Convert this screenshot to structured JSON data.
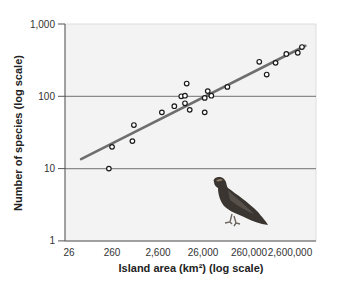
{
  "chart_data": {
    "type": "scatter",
    "title": "",
    "xlabel": "Island area (km²) (log scale)",
    "ylabel": "Number of species (log scale)",
    "x_scale": "log",
    "y_scale": "log",
    "xlim": [
      26,
      5000000
    ],
    "ylim": [
      1,
      1000
    ],
    "x_ticks": [
      "26",
      "260",
      "2,600",
      "26,000",
      "260,000",
      "2,600,000"
    ],
    "x_tick_values": [
      26,
      260,
      2600,
      26000,
      260000,
      2600000
    ],
    "y_ticks": [
      "1",
      "10",
      "100",
      "1,000"
    ],
    "y_tick_values": [
      1,
      10,
      100,
      1000
    ],
    "grid": "horizontal lines at 10 and 100",
    "legend": null,
    "series": [
      {
        "name": "Islands",
        "marker": "open circle",
        "points": [
          {
            "x": 230,
            "y": 10
          },
          {
            "x": 270,
            "y": 20
          },
          {
            "x": 760,
            "y": 24
          },
          {
            "x": 820,
            "y": 40
          },
          {
            "x": 3400,
            "y": 60
          },
          {
            "x": 6400,
            "y": 73
          },
          {
            "x": 9100,
            "y": 100
          },
          {
            "x": 11000,
            "y": 102
          },
          {
            "x": 12000,
            "y": 150
          },
          {
            "x": 11000,
            "y": 80
          },
          {
            "x": 14000,
            "y": 65
          },
          {
            "x": 30000,
            "y": 60
          },
          {
            "x": 30000,
            "y": 95
          },
          {
            "x": 35000,
            "y": 118
          },
          {
            "x": 42000,
            "y": 102
          },
          {
            "x": 95000,
            "y": 135
          },
          {
            "x": 480000,
            "y": 300
          },
          {
            "x": 700000,
            "y": 200
          },
          {
            "x": 1100000,
            "y": 290
          },
          {
            "x": 1900000,
            "y": 385
          },
          {
            "x": 3400000,
            "y": 400
          },
          {
            "x": 4200000,
            "y": 480
          }
        ]
      },
      {
        "name": "Trend line",
        "type": "line",
        "points": [
          {
            "x": 56,
            "y": 13.5
          },
          {
            "x": 5000000,
            "y": 500
          }
        ]
      }
    ],
    "annotations": [
      "bird illustration (hawk) in lower right of plot area"
    ]
  },
  "colors": {
    "plot_background": "#f3f3f3",
    "gridline": "#8a8a8a",
    "trend_line": "#6e6e6e",
    "marker_stroke": "#1a1a1a",
    "axis": "#555555"
  }
}
